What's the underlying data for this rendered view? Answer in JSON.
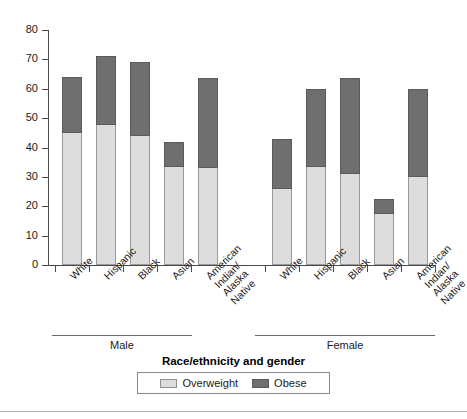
{
  "chart_data": {
    "type": "bar",
    "title": "",
    "subtitle": "",
    "xlabel": "Race/ethnicity and gender",
    "ylabel": "",
    "ylim": [
      0,
      80
    ],
    "yticks": [
      0,
      10,
      20,
      30,
      40,
      50,
      60,
      70,
      80
    ],
    "ytick_labels": [
      "0",
      "10",
      "20",
      "30",
      "40",
      "50",
      "60",
      "70",
      "80"
    ],
    "grid": false,
    "stacked": true,
    "legend_position": "bottom",
    "categories": [
      "White",
      "Hispanic",
      "Black",
      "Asian",
      "American Indian/ Alaska Native",
      "White",
      "Hispanic",
      "Black",
      "Asian",
      "American Indian/ Alaska Native"
    ],
    "groups": [
      {
        "label": "Male",
        "categories": [
          "White",
          "Hispanic",
          "Black",
          "Asian",
          "American Indian/ Alaska Native"
        ]
      },
      {
        "label": "Female",
        "categories": [
          "White",
          "Hispanic",
          "Black",
          "Asian",
          "American Indian/ Alaska Native"
        ]
      }
    ],
    "series": [
      {
        "name": "Overweight",
        "color": "#dddddd",
        "values": [
          45,
          47.5,
          44,
          33.5,
          33,
          26,
          33.5,
          31,
          17.5,
          30
        ]
      },
      {
        "name": "Obese",
        "color": "#6f6f6f",
        "values": [
          19,
          23.5,
          25,
          8.5,
          30.5,
          17,
          26.5,
          32.5,
          5,
          30
        ]
      }
    ],
    "totals": [
      64,
      71,
      69,
      42,
      63.5,
      43,
      60,
      63.5,
      22.5,
      60
    ],
    "bars": [
      {
        "gender": "Male",
        "race": "White",
        "overweight": 45,
        "obese": 19,
        "total": 64
      },
      {
        "gender": "Male",
        "race": "Hispanic",
        "overweight": 47.5,
        "obese": 23.5,
        "total": 71
      },
      {
        "gender": "Male",
        "race": "Black",
        "overweight": 44,
        "obese": 25,
        "total": 69
      },
      {
        "gender": "Male",
        "race": "Asian",
        "overweight": 33.5,
        "obese": 8.5,
        "total": 42
      },
      {
        "gender": "Male",
        "race": "American Indian/ Alaska Native",
        "overweight": 33,
        "obese": 30.5,
        "total": 63.5
      },
      {
        "gender": "Female",
        "race": "White",
        "overweight": 26,
        "obese": 17,
        "total": 43
      },
      {
        "gender": "Female",
        "race": "Hispanic",
        "overweight": 33.5,
        "obese": 26.5,
        "total": 60
      },
      {
        "gender": "Female",
        "race": "Black",
        "overweight": 31,
        "obese": 32.5,
        "total": 63.5
      },
      {
        "gender": "Female",
        "race": "Asian",
        "overweight": 17.5,
        "obese": 5,
        "total": 22.5
      },
      {
        "gender": "Female",
        "race": "American Indian/ Alaska Native",
        "overweight": 30,
        "obese": 30,
        "total": 60
      }
    ]
  },
  "category_label_lines": [
    [
      "White"
    ],
    [
      "Hispanic"
    ],
    [
      "Black"
    ],
    [
      "Asian"
    ],
    [
      "American",
      "Indian/",
      "Alaska",
      "Native"
    ],
    [
      "White"
    ],
    [
      "Hispanic"
    ],
    [
      "Black"
    ],
    [
      "Asian"
    ],
    [
      "American",
      "Indian/",
      "Alaska",
      "Native"
    ]
  ],
  "legend": {
    "items": [
      {
        "label": "Overweight",
        "color": "#dddddd"
      },
      {
        "label": "Obese",
        "color": "#6f6f6f"
      }
    ]
  },
  "colors": {
    "overweight": "#dddddd",
    "obese": "#6f6f6f",
    "axis": "#4a4a4a",
    "text": "#1a1a1a",
    "rule": "#6a6a6a"
  }
}
